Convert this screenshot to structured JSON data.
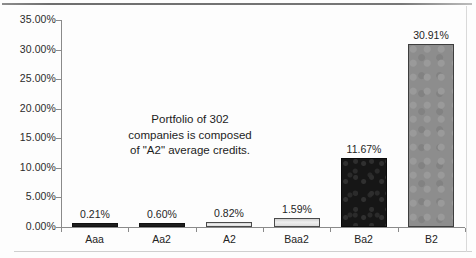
{
  "chart_data": {
    "type": "bar",
    "title": "",
    "subtitle": "",
    "xlabel": "",
    "ylabel": "",
    "categories": [
      "Aaa",
      "Aa2",
      "A2",
      "Baa2",
      "Ba2",
      "B2"
    ],
    "values": [
      0.21,
      0.6,
      0.82,
      1.59,
      11.67,
      30.91
    ],
    "value_labels": [
      "0.21%",
      "0.60%",
      "0.82%",
      "1.59%",
      "11.67%",
      "30.91%"
    ],
    "ylim": [
      0,
      35
    ],
    "ytick_values": [
      35,
      30,
      25,
      20,
      15,
      10,
      5,
      0
    ],
    "ytick_labels": [
      "35.00%",
      "30.00%",
      "25.00%",
      "20.00%",
      "15.00%",
      "10.00%",
      "5.00%",
      "0.00%"
    ],
    "grid": false,
    "legend": false,
    "legend_position": "none",
    "annotations": [
      {
        "text": "Portfolio of 302 companies is composed of \"A2\" average credits.",
        "lines": [
          "Portfolio of 302",
          "companies is composed",
          "of \"A2\" average credits."
        ]
      }
    ],
    "bar_styles": [
      "dark",
      "dark",
      "light",
      "light",
      "black-textured",
      "gray"
    ],
    "colors": {
      "bar_dark": "#1d1d1d",
      "bar_light": "#e4e4e4",
      "bar_black_textured": "#161616",
      "bar_gray": "#8d8d8d",
      "axis": "#8a8a8a",
      "text": "#1f1f1f",
      "background": "#fdfdfd"
    }
  },
  "yaxis": {
    "labels": [
      "35.00%",
      "30.00%",
      "25.00%",
      "20.00%",
      "15.00%",
      "10.00%",
      "5.00%",
      "0.00%"
    ]
  },
  "xaxis": {
    "labels": [
      "Aaa",
      "Aa2",
      "A2",
      "Baa2",
      "Ba2",
      "B2"
    ]
  },
  "bars": [
    {
      "category": "Aaa",
      "value_label": "0.21%"
    },
    {
      "category": "Aa2",
      "value_label": "0.60%"
    },
    {
      "category": "A2",
      "value_label": "0.82%"
    },
    {
      "category": "Baa2",
      "value_label": "1.59%"
    },
    {
      "category": "Ba2",
      "value_label": "11.67%"
    },
    {
      "category": "B2",
      "value_label": "30.91%"
    }
  ],
  "annotation": {
    "line1": "Portfolio of 302",
    "line2": "companies is composed",
    "line3": "of \"A2\" average credits."
  }
}
